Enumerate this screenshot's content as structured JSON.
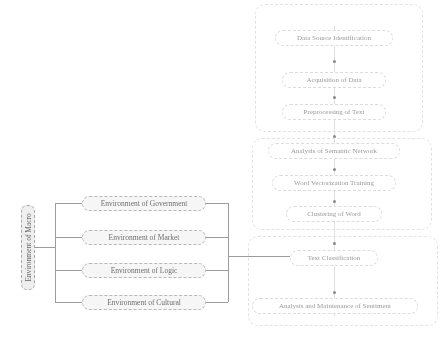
{
  "macro": {
    "label": "Environment of Macro"
  },
  "environments": [
    {
      "label": "Environment of Government"
    },
    {
      "label": "Environment of Market"
    },
    {
      "label": "Environment of Logic"
    },
    {
      "label": "Environment of Cultural"
    }
  ],
  "flow": {
    "steps": [
      {
        "label": "Data Source Identification"
      },
      {
        "label": "Acquisition of Data"
      },
      {
        "label": "Preprocessing of Text"
      },
      {
        "label": "Analysis of Semantic Network"
      },
      {
        "label": "Word Vectorization Training"
      },
      {
        "label": "Clustering of Word"
      },
      {
        "label": "Text Classification"
      },
      {
        "label": "Analysis and Maintenance of Sentiment"
      }
    ]
  },
  "colors": {
    "line": "#9c9c9c",
    "box_border": "#b8b8b8",
    "text": "#8a8a8a"
  }
}
